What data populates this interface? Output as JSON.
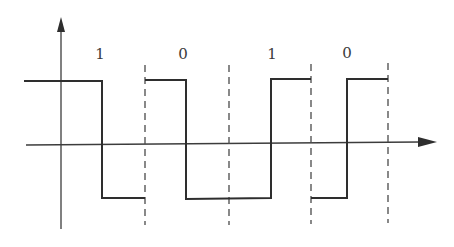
{
  "diagram": {
    "type": "square-wave-encoding",
    "bits": [
      {
        "label": "1",
        "x": 100
      },
      {
        "label": "0",
        "x": 183
      },
      {
        "label": "1",
        "x": 272
      },
      {
        "label": "0",
        "x": 347
      }
    ],
    "colors": {
      "axis": "#3c3c3c",
      "signal": "#2e2e2e",
      "dash": "#4a4a4a",
      "label": "#3a3a3a",
      "background": "#ffffff"
    }
  }
}
